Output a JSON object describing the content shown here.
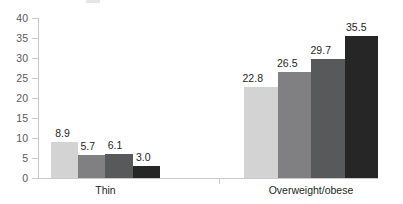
{
  "chart_data": {
    "type": "bar",
    "title": "",
    "subtitle": "",
    "xlabel": "",
    "ylabel": "",
    "categories": [
      "Thin",
      "Overweight/obese"
    ],
    "ylim": [
      0,
      40
    ],
    "ytick_step": 5,
    "yticks": [
      "40",
      "35",
      "30",
      "25",
      "20",
      "15",
      "10",
      "5",
      "0"
    ],
    "grid": false,
    "legend": "none",
    "series": [
      {
        "name": "series-1",
        "color": "#d3d3d3",
        "values": [
          8.9,
          22.8
        ]
      },
      {
        "name": "series-2",
        "color": "#808083",
        "values": [
          5.7,
          26.5
        ]
      },
      {
        "name": "series-3",
        "color": "#58595b",
        "values": [
          6.1,
          29.7
        ]
      },
      {
        "name": "series-4",
        "color": "#262626",
        "values": [
          3.0,
          35.5
        ]
      }
    ],
    "value_labels": {
      "thin": [
        "8.9",
        "5.7",
        "6.1",
        "3.0"
      ],
      "overweight_obese": [
        "22.8",
        "26.5",
        "29.7",
        "35.5"
      ]
    }
  },
  "axis": {
    "line_color": "#c9c9c9",
    "tick_color": "#c9c9c9",
    "label_color": "#58595b"
  }
}
